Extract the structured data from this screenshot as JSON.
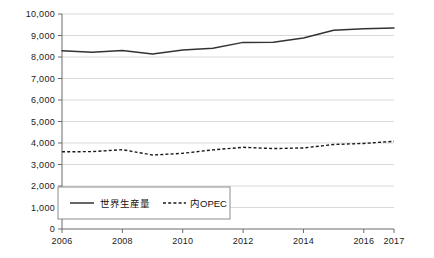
{
  "chart_data": {
    "type": "line",
    "title": "",
    "xlabel": "",
    "ylabel": "",
    "xlim": [
      2006,
      2017
    ],
    "ylim": [
      0,
      10000
    ],
    "grid": true,
    "legend_position": "bottom-left-inside",
    "x": [
      2006,
      2007,
      2008,
      2009,
      2010,
      2011,
      2012,
      2013,
      2014,
      2015,
      2016,
      2017
    ],
    "x_tick_labels": [
      "2006",
      "2008",
      "2010",
      "2012",
      "2014",
      "2016",
      "2017"
    ],
    "x_tick_values": [
      2006,
      2008,
      2010,
      2012,
      2014,
      2016,
      2017
    ],
    "y_tick_labels": [
      "10,000",
      "9,000",
      "8,000",
      "7,000",
      "6,000",
      "5,000",
      "4,000",
      "3,000",
      "2,000",
      "1,000",
      "0"
    ],
    "y_tick_values": [
      10000,
      9000,
      8000,
      7000,
      6000,
      5000,
      4000,
      3000,
      2000,
      1000,
      0
    ],
    "series": [
      {
        "name": "世界生産量",
        "style": "solid",
        "color": "#333333",
        "values": [
          8290,
          8220,
          8300,
          8140,
          8330,
          8410,
          8680,
          8690,
          8880,
          9240,
          9310,
          9350
        ]
      },
      {
        "name": "内OPEC",
        "style": "dashed",
        "color": "#1a1a1a",
        "values": [
          3590,
          3600,
          3690,
          3440,
          3520,
          3680,
          3800,
          3740,
          3770,
          3930,
          3980,
          4080
        ]
      }
    ]
  },
  "legend": {
    "entries": [
      {
        "label": "世界生産量",
        "style": "solid"
      },
      {
        "label": "内OPEC",
        "style": "dashed"
      }
    ]
  },
  "colors": {
    "background": "#ffffff",
    "axis": "#6b6b6b",
    "grid": "#cfcfcf",
    "series_solid": "#333333",
    "series_dashed": "#1a1a1a",
    "legend_border": "#8c8c8c",
    "text": "#1a1a1a"
  }
}
